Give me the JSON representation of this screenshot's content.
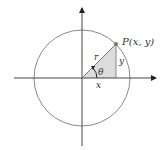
{
  "diagram": {
    "colors": {
      "axis": "#333333",
      "circle": "#888888",
      "triangle_fill": "#d9d9d9",
      "point": "#777777",
      "text": "#333333"
    },
    "labels": {
      "point": "P(x, y)",
      "radius": "r",
      "angle": "θ",
      "adjacent": "x",
      "opposite": "y"
    },
    "geometry": {
      "origin": [
        82,
        78
      ],
      "radius": 48,
      "point_P": [
        116,
        44
      ]
    }
  }
}
